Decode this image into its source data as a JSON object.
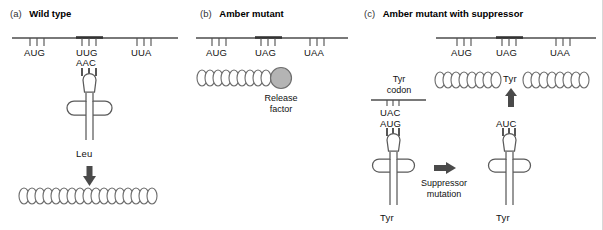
{
  "figure": {
    "title_visible": false,
    "background": "#ffffff",
    "panels": [
      {
        "tag": "(a)",
        "title": "Wild type",
        "mrna": {
          "codons": [
            "AUG",
            "UUG",
            "UUA"
          ],
          "highlighted_codon": "UUG"
        },
        "trna": {
          "anticodon": "AAC",
          "amino_acid": "Leu"
        },
        "product": "polypeptide-chain",
        "arrow": "down-arrow"
      },
      {
        "tag": "(b)",
        "title": "Amber mutant",
        "mrna": {
          "codons": [
            "AUG",
            "UAG",
            "UAA"
          ],
          "highlighted_codon": "UAG"
        },
        "release_factor": {
          "label_line1": "Release",
          "label_line2": "factor",
          "color": "#b4b4b4"
        },
        "product": "truncated-polypeptide-chain"
      },
      {
        "tag": "(c)",
        "title": "Amber mutant with suppressor",
        "mrna": {
          "codons": [
            "AUG",
            "UAG",
            "UAA"
          ],
          "highlighted_codon": "UAG"
        },
        "product": "full-length-polypeptide-chain",
        "inserted_residue": "Tyr",
        "insertion_arrow": "up-arrow",
        "suppressor_trna": {
          "anticodon": "AUC",
          "amino_acid": "Tyr"
        },
        "tyr_codon_panel": {
          "label_line1": "Tyr",
          "label_line2": "codon",
          "codon": "UAC"
        },
        "normal_trna": {
          "anticodon": "AUG",
          "amino_acid": "Tyr"
        },
        "mutation_arrow": "right-arrow",
        "mutation_label_line1": "Suppressor",
        "mutation_label_line2": "mutation"
      }
    ]
  },
  "colors": {
    "line": "#4d4d4d",
    "text": "#111111",
    "release_factor_fill": "#b4b4b4",
    "release_factor_stroke": "#6e6e6e",
    "arrow": "#4a4a4a"
  }
}
